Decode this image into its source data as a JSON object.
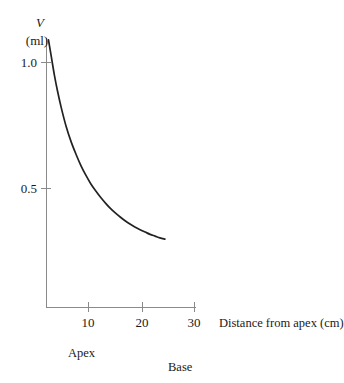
{
  "chart_data": {
    "type": "line",
    "title": "",
    "subtitle": "",
    "xlabel": "Distance from apex (cm)",
    "ylabel": "V",
    "ylabel_units": "(ml)",
    "ylabel_full": "V (ml)",
    "xlim": [
      0,
      32
    ],
    "ylim": [
      0,
      1.15
    ],
    "grid": false,
    "legend": false,
    "legend_position": "none",
    "x_ticks": [
      10,
      20,
      30
    ],
    "x_tick_labels": [
      "10",
      "20",
      "30"
    ],
    "y_ticks": [
      0.5,
      1.0
    ],
    "y_tick_labels": [
      "0.5",
      "1.0"
    ],
    "annotations": [
      {
        "text": "Apex",
        "x": 3.5,
        "y": -0.13
      },
      {
        "text": "Base",
        "x": 24.5,
        "y": -0.2
      }
    ],
    "series": [
      {
        "name": "Volume",
        "color": "#222222",
        "x": [
          0.4,
          1.0,
          1.6,
          2.2,
          3.0,
          4.0,
          5.0,
          6.0,
          7.0,
          8.0,
          9.0,
          10.0,
          11.0,
          12.0,
          13.0,
          14.0,
          15.0,
          16.0,
          17.0,
          18.0,
          19.0,
          20.0,
          21.0,
          22.0,
          23.0,
          24.0
        ],
        "y": [
          1.09,
          1.02,
          0.95,
          0.89,
          0.82,
          0.745,
          0.685,
          0.635,
          0.59,
          0.552,
          0.518,
          0.49,
          0.464,
          0.441,
          0.42,
          0.402,
          0.386,
          0.371,
          0.358,
          0.346,
          0.336,
          0.327,
          0.318,
          0.311,
          0.304,
          0.299
        ]
      }
    ]
  },
  "axis": {
    "x_tick_10": "10",
    "x_tick_20": "20",
    "x_tick_30": "30",
    "y_tick_05": "0.5",
    "y_tick_10": "1.0",
    "x_axis_title": "Distance from apex (cm)",
    "y_symbol": "V",
    "y_units": "(ml)"
  },
  "labels": {
    "apex": "Apex",
    "base": "Base"
  },
  "colors": {
    "curve": "#222222",
    "axis": "#8a8a8a",
    "text": "#1a1a1a",
    "background": "#ffffff"
  }
}
